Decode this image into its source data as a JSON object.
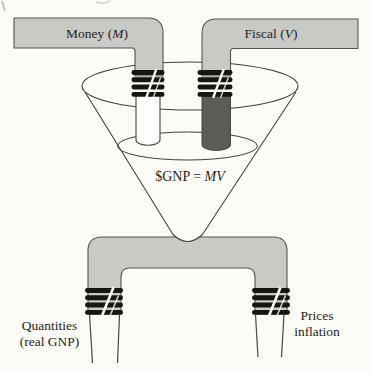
{
  "colors": {
    "background": "#fbfbf8",
    "pipe_gray": "#c9c9c6",
    "dark_pipe": "#5c5c59",
    "outline": "#45453f",
    "band": "#161613",
    "text": "#1f1f1c"
  },
  "inflows": {
    "money_label": {
      "prefix": "Money (",
      "symbol": "M",
      "suffix": ")"
    },
    "fiscal_label": {
      "prefix": "Fiscal (",
      "symbol": "V",
      "suffix": ")"
    }
  },
  "funnel": {
    "equation": {
      "prefix": "$GNP = ",
      "symbol": "MV",
      "suffix": ""
    }
  },
  "outputs": {
    "left": {
      "line1": "Quantities",
      "line2": "(real GNP)"
    },
    "right": {
      "line1": "Prices",
      "line2": "inflation"
    }
  }
}
